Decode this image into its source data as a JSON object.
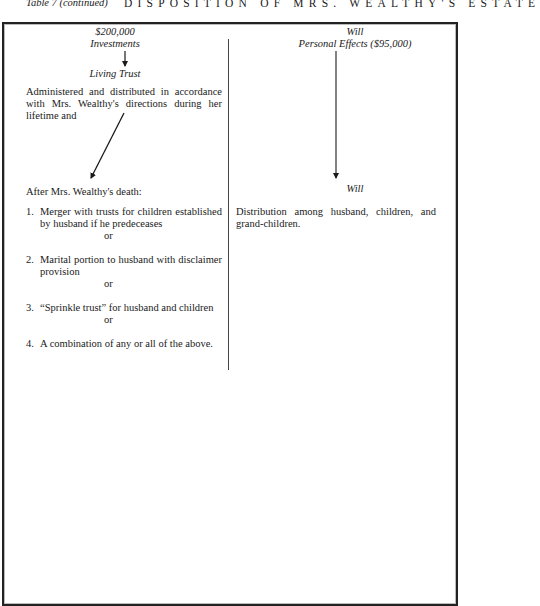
{
  "header": {
    "table_label": "Table 7 (continued)",
    "title": "DISPOSITION OF MRS. WEALTHY'S ESTATE"
  },
  "left_column": {
    "amount": "$200,000",
    "asset": "Investments",
    "vehicle": "Living Trust",
    "lifetime_text": "Administered and distributed in accordance with Mrs. Wealthy's directions during her lifetime and",
    "after_death_heading": "After Mrs. Wealthy's death:",
    "options": [
      {
        "number": "1.",
        "text": "Merger with trusts for children established by husband if he predeceases",
        "connector": "or"
      },
      {
        "number": "2.",
        "text": "Marital portion to husband with disclaimer provision",
        "connector": "or"
      },
      {
        "number": "3.",
        "text": "“Sprinkle trust” for husband and children",
        "connector": "or"
      },
      {
        "number": "4.",
        "text": "A combination of any or all of the above.",
        "connector": ""
      }
    ]
  },
  "right_column": {
    "vehicle_top": "Will",
    "asset": "Personal Effects ($95,000)",
    "vehicle_bottom": "Will",
    "distribution_text": "Distribution among husband, children, and grand-children."
  },
  "colors": {
    "ink": "#1a1a1a",
    "border": "#222222",
    "background": "#ffffff"
  }
}
